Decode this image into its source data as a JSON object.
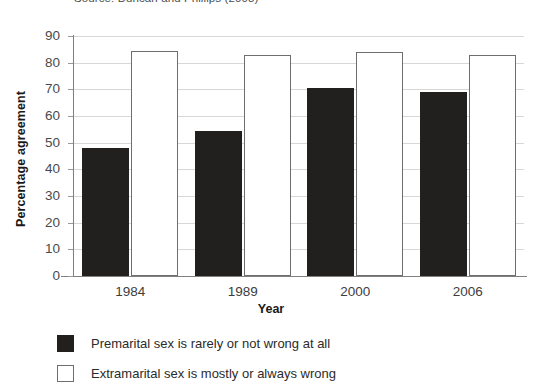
{
  "caption": {
    "source_note": "Source: Duncan and Phillips (2008)"
  },
  "chart_data": {
    "type": "bar",
    "title": "",
    "xlabel": "Year",
    "ylabel": "Percentage agreement",
    "categories": [
      "1984",
      "1989",
      "2000",
      "2006"
    ],
    "ylim": [
      0,
      90
    ],
    "ytick_labels": [
      "0",
      "10",
      "20",
      "30",
      "40",
      "50",
      "60",
      "70",
      "80",
      "90"
    ],
    "ytick_values": [
      0,
      10,
      20,
      30,
      40,
      50,
      60,
      70,
      80,
      90
    ],
    "grid": true,
    "legend_position": "below",
    "series": [
      {
        "name": "Premarital sex is rarely or not wrong at all",
        "color": "#221f1f",
        "style": "filled",
        "values": [
          48,
          54.5,
          70.5,
          69
        ]
      },
      {
        "name": "Extramarital sex is mostly or always wrong",
        "color": "#ffffff",
        "style": "outlined",
        "values": [
          84.5,
          83,
          84,
          83
        ]
      }
    ]
  }
}
